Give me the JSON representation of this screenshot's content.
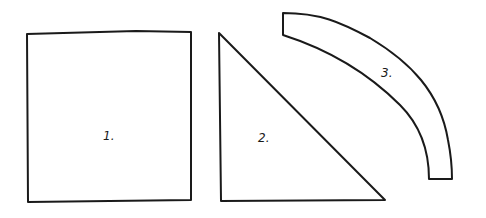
{
  "diagram": {
    "background": "#ffffff",
    "stroke_color": "#1a1a1a",
    "shapes": [
      {
        "id": "square",
        "label": "1."
      },
      {
        "id": "triangle",
        "label": "2."
      },
      {
        "id": "arc-band",
        "label": "3."
      }
    ]
  }
}
